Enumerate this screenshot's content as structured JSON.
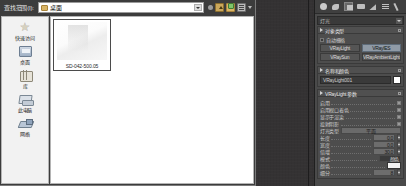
{
  "app": {
    "accent_color": "#8f9aa6",
    "panel_bg": "#4a4a4a",
    "viewport_bg": "#343233"
  },
  "file_dialog": {
    "title": "查找范围(I):",
    "address": {
      "value": "桌面",
      "placeholder": "桌面",
      "dropdown_icon": "chevron-down-icon"
    },
    "toolbar": [
      {
        "name": "back-button",
        "icon": "back-icon",
        "label": "后退"
      },
      {
        "name": "up-button",
        "icon": "up-folder-icon",
        "label": "向上"
      },
      {
        "name": "new-folder-button",
        "icon": "new-folder-icon",
        "label": "新建文件夹"
      },
      {
        "name": "views-button",
        "icon": "views-icon",
        "label": "查看"
      },
      {
        "name": "views-menu-button",
        "icon": "chevron-down-icon",
        "label": "查看菜单"
      }
    ],
    "places": [
      {
        "label": "快速访问",
        "icon": "star-icon"
      },
      {
        "label": "桌面",
        "icon": "desktop-icon"
      },
      {
        "label": "库",
        "icon": "library-icon"
      },
      {
        "label": "此电脑",
        "icon": "this-pc-icon"
      },
      {
        "label": "网络",
        "icon": "network-icon"
      }
    ],
    "files": [
      {
        "name": "SD-042-500.05",
        "selected": true
      }
    ]
  },
  "command_panel": {
    "tabs": [
      {
        "name": "create",
        "icon": "create-tab-icon",
        "selected": false
      },
      {
        "name": "modify",
        "icon": "modify-tab-icon",
        "selected": false
      },
      {
        "name": "hierarchy",
        "icon": "hierarchy-tab-icon",
        "selected": true
      },
      {
        "name": "motion",
        "icon": "motion-tab-icon",
        "selected": false
      },
      {
        "name": "display",
        "icon": "display-tab-icon",
        "selected": false
      },
      {
        "name": "utilities",
        "icon": "utilities-tab-icon",
        "selected": false
      },
      {
        "name": "tools",
        "icon": "tools-tab-icon",
        "selected": false
      }
    ],
    "object_selector": {
      "value": "灯光",
      "dropdown_icon": "chevron-down-icon"
    },
    "rollouts": [
      {
        "title": "对象类型",
        "autogrid": {
          "label": "自动栅格",
          "checked": false
        },
        "buttons": [
          {
            "label": "VRayLight",
            "active": true
          },
          {
            "label": "VRayIES",
            "active": false
          },
          {
            "label": "VRaySun",
            "active": false
          },
          {
            "label": "VRayAmbientLight",
            "active": false
          }
        ]
      },
      {
        "title": "名称和颜色",
        "name_value": "VRayLight001",
        "color_swatch": "#ffffff"
      },
      {
        "title": "VRayLight 参数",
        "params": [
          {
            "label": "启用",
            "type": "checkbox",
            "checked": true
          },
          {
            "label": "启用视口着色",
            "type": "checkbox",
            "checked": true
          },
          {
            "label": "显示于渲染",
            "type": "checkbox",
            "checked": true
          },
          {
            "label": "投射阴影",
            "type": "checkbox",
            "checked": true
          },
          {
            "label": "双面",
            "type": "checkbox",
            "checked": false
          },
          {
            "label": "灯光类型",
            "type": "dropdown",
            "value": "平面"
          },
          {
            "label": "长度",
            "type": "spinner",
            "value": "0.0"
          },
          {
            "label": "宽度",
            "type": "spinner",
            "value": "0.0"
          },
          {
            "label": "倍增",
            "type": "spinner",
            "value": "30.0"
          },
          {
            "label": "模式",
            "type": "dropdown",
            "value": "颜色"
          },
          {
            "label": "颜色",
            "type": "color",
            "value": "#f2f2f2"
          },
          {
            "label": "细分",
            "type": "spinner",
            "value": "8"
          }
        ]
      }
    ]
  }
}
